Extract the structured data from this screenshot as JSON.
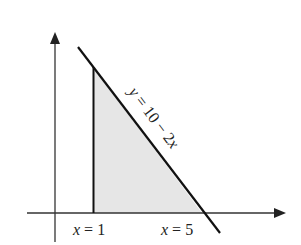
{
  "diagram": {
    "type": "region-under-line",
    "line_label": {
      "var": "y",
      "eq": " = 10 − 2",
      "var2": "x"
    },
    "bounds": [
      {
        "var": "x",
        "eq": " = 1"
      },
      {
        "var": "x",
        "eq": " = 5"
      }
    ],
    "colors": {
      "axis": "#333333",
      "line": "#111111",
      "fill": "#e6e6e6"
    }
  }
}
